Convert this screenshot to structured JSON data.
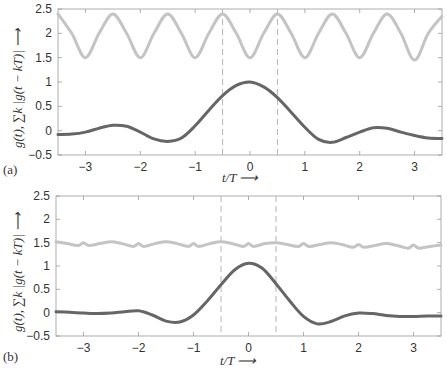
{
  "figure": {
    "panels": [
      {
        "id": "a",
        "label": "(a)"
      },
      {
        "id": "b",
        "label": "(b)"
      }
    ],
    "xlabel": "t/T ⟶",
    "ylabel": "g(t), ∑k |g(t − kT)| ⟶"
  },
  "chart_data": [
    {
      "type": "line",
      "panel": "(a)",
      "title": "",
      "xlabel": "t/T",
      "ylabel": "g(t), Σ_k |g(t − kT)|",
      "xlim": [
        -3.5,
        3.5
      ],
      "ylim": [
        -0.5,
        2.5
      ],
      "xticks": [
        -3,
        -2,
        -1,
        0,
        1,
        2,
        3
      ],
      "yticks": [
        -0.5,
        0,
        0.5,
        1,
        1.5,
        2,
        2.5
      ],
      "ytick_labels": [
        "−0.5",
        "0",
        "0.5",
        "1",
        "1.5",
        "2",
        "2.5"
      ],
      "xtick_labels": [
        "−3",
        "−2",
        "−1",
        "0",
        "1",
        "2",
        "3"
      ],
      "grid": false,
      "vlines_dashed": [
        -0.5,
        0.5
      ],
      "series": [
        {
          "name": "sum_k |g(t-kT)|",
          "color": "#c4c4c4",
          "width": 3,
          "x": [
            -3.5,
            -3.25,
            -3.0,
            -2.75,
            -2.5,
            -2.25,
            -2.0,
            -1.75,
            -1.5,
            -1.25,
            -1.0,
            -0.75,
            -0.5,
            -0.25,
            0.0,
            0.25,
            0.5,
            0.75,
            1.0,
            1.25,
            1.5,
            1.75,
            2.0,
            2.25,
            2.5,
            2.75,
            3.0,
            3.25,
            3.5
          ],
          "y": [
            2.4,
            2.0,
            1.5,
            2.0,
            2.4,
            2.0,
            1.5,
            2.0,
            2.4,
            2.0,
            1.5,
            2.0,
            2.4,
            2.0,
            1.5,
            2.0,
            2.4,
            2.0,
            1.5,
            2.0,
            2.4,
            2.0,
            1.5,
            2.0,
            2.4,
            2.0,
            1.45,
            2.0,
            2.35
          ]
        },
        {
          "name": "g(t)",
          "color": "#666666",
          "width": 3,
          "x": [
            -3.5,
            -3.25,
            -3.0,
            -2.75,
            -2.5,
            -2.25,
            -2.0,
            -1.75,
            -1.5,
            -1.25,
            -1.0,
            -0.75,
            -0.5,
            -0.25,
            0.0,
            0.25,
            0.5,
            0.75,
            1.0,
            1.25,
            1.5,
            1.75,
            2.0,
            2.25,
            2.5,
            2.75,
            3.0,
            3.25,
            3.5
          ],
          "y": [
            -0.08,
            -0.07,
            -0.03,
            0.05,
            0.11,
            0.09,
            -0.03,
            -0.17,
            -0.22,
            -0.15,
            0.1,
            0.42,
            0.72,
            0.93,
            1.0,
            0.9,
            0.68,
            0.38,
            0.07,
            -0.18,
            -0.24,
            -0.14,
            -0.03,
            0.06,
            0.05,
            -0.03,
            -0.1,
            -0.15,
            -0.16
          ]
        }
      ]
    },
    {
      "type": "line",
      "panel": "(b)",
      "title": "",
      "xlabel": "t/T",
      "ylabel": "g(t), Σ_k |g(t − kT)|",
      "xlim": [
        -3.5,
        3.5
      ],
      "ylim": [
        -0.5,
        2.5
      ],
      "xticks": [
        -3,
        -2,
        -1,
        0,
        1,
        2,
        3
      ],
      "yticks": [
        -0.5,
        0,
        0.5,
        1,
        1.5,
        2,
        2.5
      ],
      "ytick_labels": [
        "−0.5",
        "0",
        "0.5",
        "1",
        "1.5",
        "2",
        "2.5"
      ],
      "xtick_labels": [
        "−3",
        "−2",
        "−1",
        "0",
        "1",
        "2",
        "3"
      ],
      "grid": false,
      "vlines_dashed": [
        -0.5,
        0.5
      ],
      "series": [
        {
          "name": "sum_k |g(t-kT)|",
          "color": "#c4c4c4",
          "width": 3,
          "x": [
            -3.5,
            -3.3,
            -3.1,
            -3.0,
            -2.9,
            -2.7,
            -2.5,
            -2.3,
            -2.1,
            -2.0,
            -1.9,
            -1.7,
            -1.5,
            -1.3,
            -1.1,
            -1.0,
            -0.9,
            -0.7,
            -0.5,
            -0.3,
            -0.1,
            0.0,
            0.1,
            0.3,
            0.5,
            0.7,
            0.9,
            1.0,
            1.1,
            1.3,
            1.5,
            1.7,
            1.9,
            2.0,
            2.1,
            2.3,
            2.5,
            2.7,
            2.9,
            3.0,
            3.1,
            3.3,
            3.5
          ],
          "y": [
            1.52,
            1.48,
            1.44,
            1.5,
            1.44,
            1.48,
            1.52,
            1.48,
            1.42,
            1.48,
            1.42,
            1.48,
            1.52,
            1.48,
            1.42,
            1.48,
            1.42,
            1.48,
            1.52,
            1.48,
            1.42,
            1.48,
            1.42,
            1.48,
            1.5,
            1.46,
            1.42,
            1.48,
            1.42,
            1.46,
            1.5,
            1.46,
            1.4,
            1.46,
            1.4,
            1.44,
            1.48,
            1.44,
            1.38,
            1.45,
            1.38,
            1.42,
            1.45
          ]
        },
        {
          "name": "g(t)",
          "color": "#666666",
          "width": 3,
          "x": [
            -3.5,
            -3.25,
            -3.0,
            -2.75,
            -2.5,
            -2.25,
            -2.0,
            -1.75,
            -1.5,
            -1.25,
            -1.0,
            -0.75,
            -0.5,
            -0.25,
            0.0,
            0.25,
            0.5,
            0.75,
            1.0,
            1.25,
            1.5,
            1.75,
            2.0,
            2.25,
            2.5,
            2.75,
            3.0,
            3.25,
            3.5
          ],
          "y": [
            0.02,
            0.01,
            -0.01,
            -0.02,
            -0.01,
            0.02,
            0.04,
            -0.05,
            -0.18,
            -0.2,
            -0.05,
            0.25,
            0.6,
            0.92,
            1.06,
            0.95,
            0.62,
            0.25,
            -0.08,
            -0.24,
            -0.19,
            -0.07,
            -0.01,
            -0.02,
            -0.06,
            -0.08,
            -0.08,
            -0.07,
            -0.07
          ]
        }
      ]
    }
  ]
}
